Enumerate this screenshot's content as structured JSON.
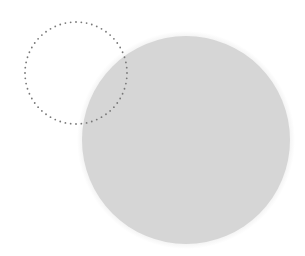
{
  "canvas": {
    "width": 305,
    "height": 256,
    "background_color": "#ffffff"
  },
  "shapes": {
    "filled_circle": {
      "name": "Filled Circle",
      "center_x": 186,
      "center_y": 140,
      "radius": 104,
      "fill_color": "#d6d6d6",
      "halo_color": "#ededed",
      "halo_width": 5
    },
    "marquee_circle": {
      "name": "Dotted Selection Marquee",
      "center_x": 76,
      "center_y": 73,
      "radius": 51,
      "dot_color": "#787878",
      "dot_radius": 0.9,
      "dot_count": 60,
      "stroke_style": "dotted"
    }
  }
}
